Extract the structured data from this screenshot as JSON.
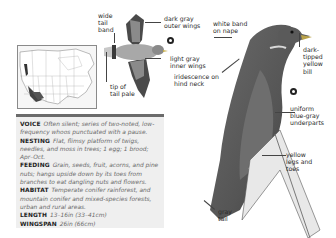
{
  "labels": {
    "wide_tail_band": "wide\ntail\nband",
    "tip_of_tail_pale": "tip of\ntail pale",
    "dark_gray_outer_wings": "dark gray\nouter wings",
    "light_gray_inner_wings": "light gray\ninner wings",
    "white_band_on_nape": "white band\non nape",
    "iridescence_on_hind_neck": "iridescence on\nhind neck",
    "dark_tipped_yellow_bill": "dark-\ntipped\nyellow\nbill",
    "uniform_blue_gray_underparts": "uniform\nblue-gray\nunderparts",
    "yellow_legs_and_toes": "yellow\nlegs and\ntoes",
    "gray_tail": "gray\ntail"
  },
  "info": [
    {
      "key": "VOICE",
      "value": "Often silent; series of two-noted, low-frequency whoos punctuated with a pause."
    },
    {
      "key": "NESTING",
      "value": "Flat, flimsy platform of twigs, needles, and moss in trees; 1 egg; 1 brood; Apr–Oct."
    },
    {
      "key": "FEEDING",
      "value": "Grain, seeds, fruit, acorns, and pine nuts; hangs upside down by its toes from branches to eat dangling nuts and flowers."
    },
    {
      "key": "HABITAT",
      "value": "Temperate conifer rainforest, and mountain conifer and mixed-species forests, urban and rural areas."
    },
    {
      "key": "LENGTH",
      "value": "13–16in (33–41cm)"
    },
    {
      "key": "WINGSPAN",
      "value": "26in (66cm)"
    }
  ],
  "colors": {
    "panel_bg": "#efefef",
    "bar": "#6b6b6b",
    "bird_dark": "#4a4a4a",
    "bird_mid": "#8a8a8a",
    "bird_light": "#b5b5b5"
  }
}
